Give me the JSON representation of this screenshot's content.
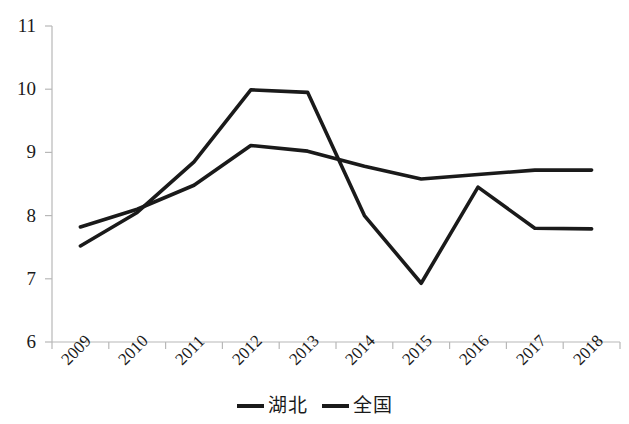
{
  "chart_data": {
    "type": "line",
    "title": "",
    "subtitle": "",
    "xlabel": "",
    "ylabel": "",
    "categories": [
      "2009",
      "2010",
      "2011",
      "2012",
      "2013",
      "2014",
      "2015",
      "2016",
      "2017",
      "2018"
    ],
    "ylim": [
      6,
      11
    ],
    "y_ticks": [
      "6",
      "7",
      "8",
      "9",
      "10",
      "11"
    ],
    "grid": false,
    "legend_position": "bottom",
    "series": [
      {
        "name": "湖北",
        "color": "#1a1a1a",
        "values": [
          7.52,
          8.05,
          8.85,
          9.99,
          9.95,
          8.0,
          6.93,
          8.45,
          7.8,
          7.79
        ]
      },
      {
        "name": "全国",
        "color": "#1a1a1a",
        "values": [
          7.82,
          8.1,
          8.48,
          9.11,
          9.02,
          8.78,
          8.58,
          8.65,
          8.72,
          8.72
        ]
      }
    ]
  },
  "axis": {
    "y_tick_labels": [
      "11",
      "10",
      "9",
      "8",
      "7",
      "6"
    ],
    "x_tick_labels": [
      "2009",
      "2010",
      "2011",
      "2012",
      "2013",
      "2014",
      "2015",
      "2016",
      "2017",
      "2018"
    ]
  },
  "legend": {
    "items": [
      {
        "label": "湖北"
      },
      {
        "label": "全国"
      }
    ]
  }
}
